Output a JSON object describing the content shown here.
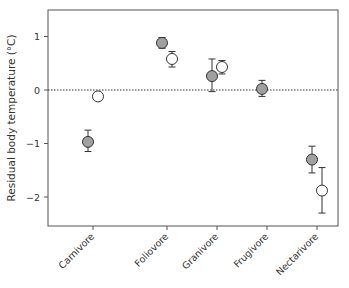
{
  "chart_data": {
    "type": "scatter",
    "title": "",
    "xlabel": "",
    "ylabel": "Residual body temperature (°C)",
    "ylim": [
      -2.5,
      1.5
    ],
    "yticks": [
      1,
      0,
      -1,
      -2
    ],
    "ytick_labels": [
      "1",
      "0",
      "−1",
      "−2"
    ],
    "grid": false,
    "reference_line": {
      "y": 0,
      "style": "dotted"
    },
    "categories": [
      "Carnivore",
      "Foliovore",
      "Granivore",
      "Frugivore",
      "Nectarivore"
    ],
    "series": [
      {
        "name": "grey (filled)",
        "color": "#a0a0a0",
        "points": [
          {
            "category": "Carnivore",
            "value": -0.97,
            "err_low": -1.15,
            "err_high": -0.75
          },
          {
            "category": "Foliovore",
            "value": 0.88,
            "err_low": 0.78,
            "err_high": 0.98
          },
          {
            "category": "Granivore",
            "value": 0.26,
            "err_low": -0.03,
            "err_high": 0.58
          },
          {
            "category": "Frugivore",
            "value": 0.02,
            "err_low": -0.12,
            "err_high": 0.18
          },
          {
            "category": "Nectarivore",
            "value": -1.3,
            "err_low": -1.55,
            "err_high": -1.05
          }
        ]
      },
      {
        "name": "white (open)",
        "color": "#ffffff",
        "points": [
          {
            "category": "Carnivore",
            "value": -0.12,
            "err_low": null,
            "err_high": null
          },
          {
            "category": "Foliovore",
            "value": 0.58,
            "err_low": 0.43,
            "err_high": 0.72
          },
          {
            "category": "Granivore",
            "value": 0.43,
            "err_low": 0.3,
            "err_high": 0.55
          },
          {
            "category": "Nectarivore",
            "value": -1.88,
            "err_low": -2.3,
            "err_high": -1.45
          }
        ]
      }
    ],
    "legend": null
  }
}
